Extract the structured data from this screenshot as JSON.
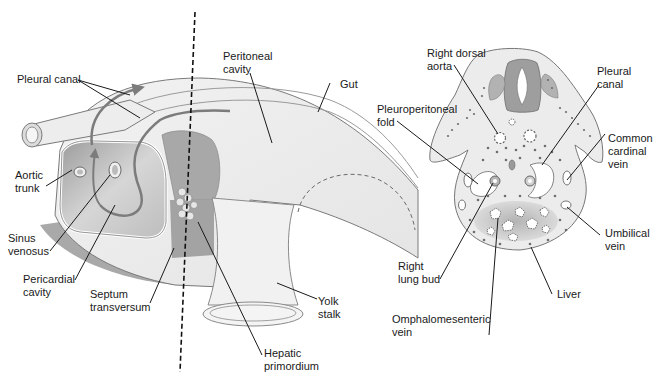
{
  "figure": {
    "left_panel": {
      "name": "Sagittal view of embryo showing pleural canals and septum transversum",
      "section_line": "dashed vertical line indicating plane of cross section",
      "labels": {
        "pleural_canal": "Pleural canal",
        "peritoneal_cavity_1": "Peritoneal",
        "peritoneal_cavity_2": "cavity",
        "gut": "Gut",
        "aortic_trunk_1": "Aortic",
        "aortic_trunk_2": "trunk",
        "sinus_venosus_1": "Sinus",
        "sinus_venosus_2": "venosus",
        "pericardial_cavity_1": "Pericardial",
        "pericardial_cavity_2": "cavity",
        "septum_transversum_1": "Septum",
        "septum_transversum_2": "transversum",
        "yolk_stalk_1": "Yolk",
        "yolk_stalk_2": "stalk",
        "hepatic_primordium_1": "Hepatic",
        "hepatic_primordium_2": "primordium"
      }
    },
    "right_panel": {
      "name": "Transverse section through embryo at level of dashed line",
      "labels": {
        "right_dorsal_aorta_1": "Right dorsal",
        "right_dorsal_aorta_2": "aorta",
        "pleural_canal_1": "Pleural",
        "pleural_canal_2": "canal",
        "pleuroperitoneal_fold_1": "Pleuroperitoneal",
        "pleuroperitoneal_fold_2": "fold",
        "common_cardinal_vein_1": "Common",
        "common_cardinal_vein_2": "cardinal",
        "common_cardinal_vein_3": "vein",
        "umbilical_vein_1": "Umbilical",
        "umbilical_vein_2": "vein",
        "right_lung_bud_1": "Right",
        "right_lung_bud_2": "lung bud",
        "liver": "Liver",
        "omphalomesenteric_vein_1": "Omphalomesenteric",
        "omphalomesenteric_vein_2": "vein"
      }
    },
    "colors": {
      "light_tissue": "#ececec",
      "mid_tissue": "#c8c8c8",
      "dark_tissue": "#a4a4a4",
      "arrow": "#7c7c7c",
      "text": "#1a1a1a"
    }
  }
}
